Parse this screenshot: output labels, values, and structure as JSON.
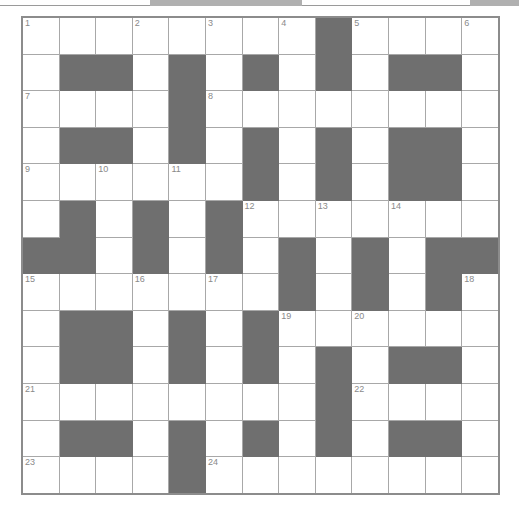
{
  "puzzle": {
    "title": "Crossword Grid",
    "rows": 13,
    "cols": 13,
    "block_color": "#6f6f6f",
    "cell_color": "#ffffff",
    "grid_border_color": "#8c8c8c",
    "cell_border_color": "#a8a8a8",
    "number_color": "#8a8a8a",
    "highest_clue_number": 24,
    "clue_numbers": [
      1,
      2,
      3,
      4,
      5,
      6,
      7,
      8,
      9,
      10,
      11,
      12,
      13,
      14,
      15,
      16,
      17,
      18,
      19,
      20,
      21,
      22,
      23,
      24
    ],
    "legend": {
      "0": "open cell",
      "1": "blocked cell"
    },
    "cells": [
      [
        0,
        0,
        0,
        0,
        0,
        0,
        0,
        0,
        1,
        0,
        0,
        0,
        0
      ],
      [
        0,
        1,
        1,
        0,
        1,
        0,
        1,
        0,
        1,
        0,
        1,
        1,
        0
      ],
      [
        0,
        0,
        0,
        0,
        1,
        0,
        0,
        0,
        0,
        0,
        0,
        0,
        0
      ],
      [
        0,
        1,
        1,
        0,
        1,
        0,
        1,
        0,
        1,
        0,
        1,
        1,
        0
      ],
      [
        0,
        0,
        0,
        0,
        0,
        0,
        1,
        0,
        1,
        0,
        1,
        1,
        0
      ],
      [
        0,
        1,
        0,
        1,
        0,
        1,
        0,
        0,
        0,
        0,
        0,
        0,
        0
      ],
      [
        1,
        1,
        0,
        1,
        0,
        1,
        0,
        1,
        0,
        1,
        0,
        1,
        1
      ],
      [
        0,
        0,
        0,
        0,
        0,
        0,
        0,
        1,
        0,
        1,
        0,
        1,
        0
      ],
      [
        0,
        1,
        1,
        0,
        1,
        0,
        1,
        0,
        0,
        0,
        0,
        0,
        0
      ],
      [
        0,
        1,
        1,
        0,
        1,
        0,
        1,
        0,
        1,
        0,
        1,
        1,
        0
      ],
      [
        0,
        0,
        0,
        0,
        0,
        0,
        0,
        0,
        1,
        0,
        0,
        0,
        0
      ],
      [
        0,
        1,
        1,
        0,
        1,
        0,
        1,
        0,
        1,
        0,
        1,
        1,
        0
      ],
      [
        0,
        0,
        0,
        0,
        1,
        0,
        0,
        0,
        0,
        0,
        0,
        0,
        0
      ]
    ],
    "numbers": [
      [
        1,
        0,
        0,
        2,
        0,
        3,
        0,
        4,
        0,
        5,
        0,
        0,
        6
      ],
      [
        0,
        0,
        0,
        0,
        0,
        0,
        0,
        0,
        0,
        0,
        0,
        0,
        0
      ],
      [
        7,
        0,
        0,
        0,
        0,
        8,
        0,
        0,
        0,
        0,
        0,
        0,
        0
      ],
      [
        0,
        0,
        0,
        0,
        0,
        0,
        0,
        0,
        0,
        0,
        0,
        0,
        0
      ],
      [
        9,
        0,
        10,
        0,
        11,
        0,
        0,
        0,
        0,
        0,
        0,
        0,
        0
      ],
      [
        0,
        0,
        0,
        0,
        0,
        0,
        12,
        0,
        13,
        0,
        14,
        0,
        0
      ],
      [
        0,
        0,
        0,
        0,
        0,
        0,
        0,
        0,
        0,
        0,
        0,
        0,
        0
      ],
      [
        15,
        0,
        0,
        16,
        0,
        17,
        0,
        0,
        0,
        0,
        0,
        0,
        18
      ],
      [
        0,
        0,
        0,
        0,
        0,
        0,
        0,
        19,
        0,
        20,
        0,
        0,
        0
      ],
      [
        0,
        0,
        0,
        0,
        0,
        0,
        0,
        0,
        0,
        0,
        0,
        0,
        0
      ],
      [
        21,
        0,
        0,
        0,
        0,
        0,
        0,
        0,
        0,
        22,
        0,
        0,
        0
      ],
      [
        0,
        0,
        0,
        0,
        0,
        0,
        0,
        0,
        0,
        0,
        0,
        0,
        0
      ],
      [
        23,
        0,
        0,
        0,
        0,
        24,
        0,
        0,
        0,
        0,
        0,
        0,
        0
      ]
    ],
    "letters": [
      [
        "",
        "",
        "",
        "",
        "",
        "",
        "",
        "",
        "",
        "",
        "",
        "",
        ""
      ],
      [
        "",
        "",
        "",
        "",
        "",
        "",
        "",
        "",
        "",
        "",
        "",
        "",
        ""
      ],
      [
        "",
        "",
        "",
        "",
        "",
        "",
        "",
        "",
        "",
        "",
        "",
        "",
        ""
      ],
      [
        "",
        "",
        "",
        "",
        "",
        "",
        "",
        "",
        "",
        "",
        "",
        "",
        ""
      ],
      [
        "",
        "",
        "",
        "",
        "",
        "",
        "",
        "",
        "",
        "",
        "",
        "",
        ""
      ],
      [
        "",
        "",
        "",
        "",
        "",
        "",
        "",
        "",
        "",
        "",
        "",
        "",
        ""
      ],
      [
        "",
        "",
        "",
        "",
        "",
        "",
        "",
        "",
        "",
        "",
        "",
        "",
        ""
      ],
      [
        "",
        "",
        "",
        "",
        "",
        "",
        "",
        "",
        "",
        "",
        "",
        "",
        ""
      ],
      [
        "",
        "",
        "",
        "",
        "",
        "",
        "",
        "",
        "",
        "",
        "",
        "",
        ""
      ],
      [
        "",
        "",
        "",
        "",
        "",
        "",
        "",
        "",
        "",
        "",
        "",
        "",
        ""
      ],
      [
        "",
        "",
        "",
        "",
        "",
        "",
        "",
        "",
        "",
        "",
        "",
        "",
        ""
      ],
      [
        "",
        "",
        "",
        "",
        "",
        "",
        "",
        "",
        "",
        "",
        "",
        "",
        ""
      ],
      [
        "",
        "",
        "",
        "",
        "",
        "",
        "",
        "",
        "",
        "",
        "",
        "",
        ""
      ]
    ]
  },
  "top_strip": {
    "description": "clipped bottom edge of a preceding grid",
    "segments": [
      {
        "x": 0,
        "w": 150,
        "type": "line"
      },
      {
        "x": 150,
        "w": 152,
        "type": "blk"
      },
      {
        "x": 302,
        "w": 168,
        "type": "line"
      },
      {
        "x": 470,
        "w": 49,
        "type": "blk"
      }
    ]
  }
}
